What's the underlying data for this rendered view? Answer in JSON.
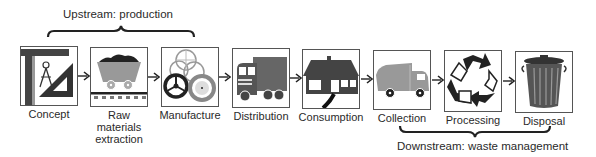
{
  "upstream": {
    "label": "Upstream: production"
  },
  "downstream": {
    "label": "Downstream: waste management"
  },
  "stages": [
    {
      "label": "Concept",
      "icon": "drafting-tools-icon"
    },
    {
      "label": "Raw materials extraction",
      "label_lines": [
        "Raw",
        "materials",
        "extraction"
      ],
      "icon": "mine-cart-icon"
    },
    {
      "label": "Manufacture",
      "icon": "wheels-icon"
    },
    {
      "label": "Distribution",
      "icon": "truck-icon"
    },
    {
      "label": "Consumption",
      "icon": "house-icon"
    },
    {
      "label": "Collection",
      "icon": "garbage-truck-icon"
    },
    {
      "label": "Processing",
      "icon": "recycle-icon"
    },
    {
      "label": "Disposal",
      "icon": "trash-can-icon"
    }
  ],
  "colors": {
    "dark": "#333333",
    "mid": "#888888",
    "light": "#bbbbbb",
    "border": "#555555"
  }
}
